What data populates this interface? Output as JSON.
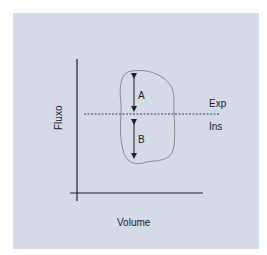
{
  "diagram": {
    "y_axis_label": "Fluxo",
    "x_axis_label": "Volume",
    "upper_region_label": "Exp",
    "lower_region_label": "Ins",
    "arrow_upper_label": "A",
    "arrow_lower_label": "B"
  },
  "colors": {
    "panel": "#d3dbe6",
    "axes": "#222222",
    "loop": "#7f8f85",
    "baseline": "#444444"
  }
}
